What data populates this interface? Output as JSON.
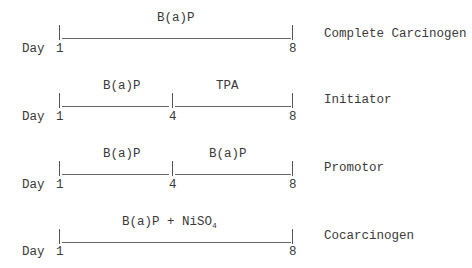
{
  "axis_label": "Day",
  "rows": [
    {
      "category": "Complete Carcinogen",
      "start_day": "1",
      "end_day": "8",
      "segments": [
        {
          "label": "B(a)P",
          "from_day": 1,
          "to_day": 8
        }
      ]
    },
    {
      "category": "Initiator",
      "start_day": "1",
      "mid_day": "4",
      "end_day": "8",
      "segments": [
        {
          "label": "B(a)P",
          "from_day": 1,
          "to_day": 4
        },
        {
          "label": "TPA",
          "from_day": 4,
          "to_day": 8
        }
      ]
    },
    {
      "category": "Promotor",
      "start_day": "1",
      "mid_day": "4",
      "end_day": "8",
      "segments": [
        {
          "label": "B(a)P",
          "from_day": 1,
          "to_day": 4
        },
        {
          "label": "B(a)P",
          "from_day": 4,
          "to_day": 8
        }
      ]
    },
    {
      "category": "Cocarcinogen",
      "start_day": "1",
      "end_day": "8",
      "segments": [
        {
          "label_main": "B(a)P + NiSO",
          "label_sub": "4",
          "from_day": 1,
          "to_day": 8
        }
      ]
    }
  ]
}
